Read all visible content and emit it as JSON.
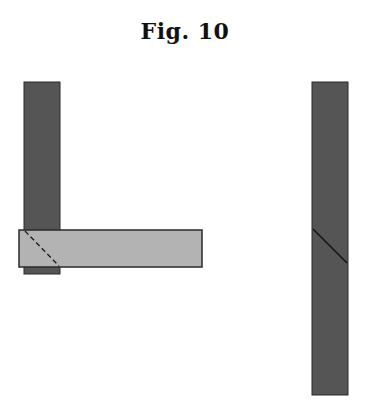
{
  "figure": {
    "title": "Fig. 10"
  },
  "colors": {
    "dark_member": "#555555",
    "light_member": "#b3b3b3",
    "outline": "#2a2a2a",
    "cut_line": "#1a1a1a",
    "background": "#ffffff"
  },
  "shapes": {
    "left_assembly": {
      "vertical_member": {
        "x": 24,
        "y": 82,
        "width": 36,
        "height": 192
      },
      "horizontal_member": {
        "x": 19,
        "y": 230,
        "width": 183,
        "height": 37
      },
      "hidden_miter_line": {
        "x1": 25,
        "y1": 231,
        "x2": 59,
        "y2": 266,
        "style": "dashed"
      }
    },
    "right_assembly": {
      "vertical_member": {
        "x": 312,
        "y": 82,
        "width": 36,
        "height": 313
      },
      "miter_cut_line": {
        "x1": 313,
        "y1": 229,
        "x2": 347,
        "y2": 263,
        "style": "solid"
      }
    }
  }
}
